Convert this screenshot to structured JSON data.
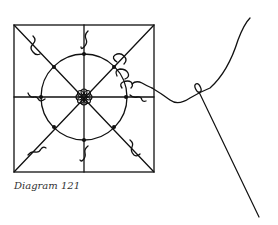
{
  "diagram": {
    "caption": "Diagram 121",
    "line_color": "#111111",
    "background": "#ffffff",
    "elements": [
      "square-frame",
      "diagonal-lines",
      "cross-lines",
      "circle",
      "center-rosette",
      "stitch-dots",
      "thread-loops",
      "thread",
      "needle"
    ]
  }
}
